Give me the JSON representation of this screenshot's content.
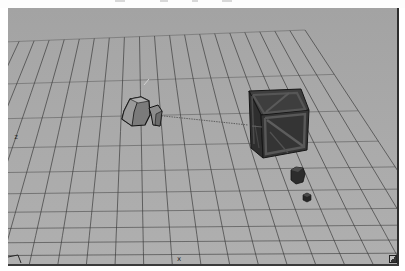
{
  "viewport": {
    "name": "3D Perspective Viewport",
    "background": "#a9a9a9",
    "grid_color": "#3c3c3c",
    "grid": {
      "divisions_x": 20,
      "divisions_z": 20,
      "corners": {
        "far_left": [
          -4,
          34
        ],
        "far_right": [
          297,
          22
        ],
        "near_right": [
          500,
          330
        ],
        "near_left": [
          -160,
          330
        ]
      }
    },
    "axis_labels": {
      "z": "z",
      "x": "x",
      "y": "y"
    },
    "objects": [
      {
        "name": "camera",
        "type": "camera-gizmo",
        "color": "#7d7d7d"
      },
      {
        "name": "crate",
        "type": "textured-cube",
        "color": "#3a3a3a"
      },
      {
        "name": "small-cube",
        "type": "cube",
        "color": "#2b2b2b"
      },
      {
        "name": "tiny-cube",
        "type": "cube",
        "color": "#262626"
      }
    ],
    "camera_target_line_color": "#4a4a4a"
  }
}
